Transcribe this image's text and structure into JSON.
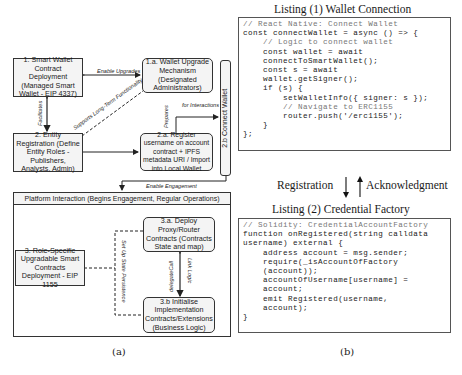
{
  "diagram_a": {
    "caption": "(a)",
    "boxes": {
      "b1": "1. Smart Wallet Contract Deployment (Managed Smart Wallet - EIP 4337)",
      "b1a": "1.a. Wallet Upgrade Mechanism (Designated Administrators)",
      "b2": "2. Entity Registration (Define Entity Roles - Publishers, Analysts, Admin)",
      "b2a": "2.a. Register username on account contract + IPFS metadata URI / Import into Local Wallet",
      "b2b": "2.b Connect Wallet",
      "b3": "3. Role-Specific Upgradable Smart Contracts Deployment - EIP 1155",
      "b3a": "3.a. Deploy Proxy/Router Contracts (Contracts State and map)",
      "b3b": "3.b Initialise Implementation Contracts/Extensions (Business Logic)"
    },
    "platform_header": "Platform Interaction (Begins Engagement, Regular Operations)",
    "edge_labels": {
      "enable_upgrades": "Enable Upgrades",
      "facilitates": "Facilitates",
      "supports": "Supports Long-Term Functionality",
      "prepares": "Prepares",
      "for_interactions": "for Interactions",
      "enable_engagement": "Enable Engagement",
      "set_up_state": "Set Up State Persistence",
      "delegate_call": "delegateCall",
      "link_logic": "Link Logic"
    }
  },
  "diagram_b": {
    "caption": "(b)",
    "listing1": {
      "title": "Listing (1) Wallet Connection",
      "lines": [
        {
          "text": "// React Native: Connect Wallet",
          "comment": true
        },
        {
          "text": "const connectWallet = async () => {",
          "comment": false
        },
        {
          "text": "    // Logic to connect wallet",
          "comment": true
        },
        {
          "text": "    const wallet = await",
          "comment": false
        },
        {
          "text": "    connectToSmartWallet();",
          "comment": false
        },
        {
          "text": "    const s = await",
          "comment": false
        },
        {
          "text": "    wallet.getSigner();",
          "comment": false
        },
        {
          "text": "    if (s) {",
          "comment": false
        },
        {
          "text": "        setWalletInfo({ signer: s });",
          "comment": false
        },
        {
          "text": "        // Navigate to ERC1155",
          "comment": true
        },
        {
          "text": "        router.push('/erc1155');",
          "comment": false
        },
        {
          "text": "    }",
          "comment": false
        },
        {
          "text": "};",
          "comment": false
        }
      ]
    },
    "flow": {
      "registration": "Registration",
      "acknowledgment": "Acknowledgment"
    },
    "listing2": {
      "title": "Listing (2) Credential Factory",
      "lines": [
        {
          "text": "// Solidity: CredentialAccountFactory",
          "comment": true
        },
        {
          "text": "function onRegistered(string calldata",
          "comment": false
        },
        {
          "text": "username) external {",
          "comment": false
        },
        {
          "text": "    address account = msg.sender;",
          "comment": false
        },
        {
          "text": "    require(_isAccountOfFactory",
          "comment": false
        },
        {
          "text": "    (account));",
          "comment": false
        },
        {
          "text": "    accountOfUsername[username] =",
          "comment": false
        },
        {
          "text": "    account;",
          "comment": false
        },
        {
          "text": "    emit Registered(username,",
          "comment": false
        },
        {
          "text": "    account);",
          "comment": false
        },
        {
          "text": "}",
          "comment": false
        }
      ]
    }
  }
}
